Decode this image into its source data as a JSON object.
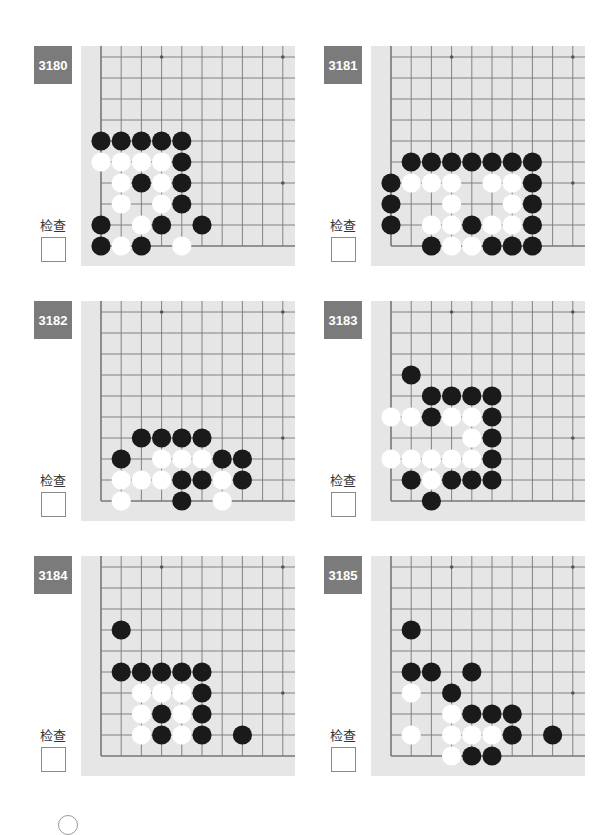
{
  "page": {
    "check_label": "检查",
    "grid": {
      "cols": 10,
      "rows": 10,
      "star_points": [
        [
          3,
          9
        ],
        [
          9,
          9
        ],
        [
          9,
          3
        ]
      ]
    },
    "colors": {
      "badge": "#7b7b7b",
      "board": "#e6e6e6",
      "line": "#777777",
      "black": "#1a1a1a",
      "white": "#ffffff"
    }
  },
  "problems": [
    {
      "number": "3180",
      "black": [
        [
          0,
          5
        ],
        [
          1,
          5
        ],
        [
          2,
          5
        ],
        [
          3,
          5
        ],
        [
          4,
          5
        ],
        [
          4,
          4
        ],
        [
          2,
          3
        ],
        [
          4,
          3
        ],
        [
          4,
          2
        ],
        [
          0,
          1
        ],
        [
          3,
          1
        ],
        [
          5,
          1
        ],
        [
          0,
          0
        ],
        [
          2,
          0
        ]
      ],
      "white": [
        [
          0,
          4
        ],
        [
          1,
          4
        ],
        [
          2,
          4
        ],
        [
          3,
          4
        ],
        [
          1,
          3
        ],
        [
          3,
          3
        ],
        [
          1,
          2
        ],
        [
          3,
          2
        ],
        [
          2,
          1
        ],
        [
          1,
          0
        ],
        [
          4,
          0
        ]
      ]
    },
    {
      "number": "3181",
      "black": [
        [
          1,
          4
        ],
        [
          2,
          4
        ],
        [
          3,
          4
        ],
        [
          4,
          4
        ],
        [
          5,
          4
        ],
        [
          6,
          4
        ],
        [
          7,
          4
        ],
        [
          0,
          3
        ],
        [
          7,
          3
        ],
        [
          0,
          2
        ],
        [
          7,
          2
        ],
        [
          0,
          1
        ],
        [
          4,
          1
        ],
        [
          7,
          1
        ],
        [
          2,
          0
        ],
        [
          5,
          0
        ],
        [
          6,
          0
        ],
        [
          7,
          0
        ]
      ],
      "white": [
        [
          1,
          3
        ],
        [
          2,
          3
        ],
        [
          3,
          3
        ],
        [
          5,
          3
        ],
        [
          6,
          3
        ],
        [
          3,
          2
        ],
        [
          6,
          2
        ],
        [
          2,
          1
        ],
        [
          3,
          1
        ],
        [
          5,
          1
        ],
        [
          6,
          1
        ],
        [
          3,
          0
        ],
        [
          4,
          0
        ]
      ]
    },
    {
      "number": "3182",
      "black": [
        [
          2,
          3
        ],
        [
          3,
          3
        ],
        [
          4,
          3
        ],
        [
          5,
          3
        ],
        [
          1,
          2
        ],
        [
          6,
          2
        ],
        [
          7,
          2
        ],
        [
          4,
          1
        ],
        [
          5,
          1
        ],
        [
          7,
          1
        ],
        [
          4,
          0
        ]
      ],
      "white": [
        [
          3,
          2
        ],
        [
          4,
          2
        ],
        [
          5,
          2
        ],
        [
          1,
          1
        ],
        [
          2,
          1
        ],
        [
          3,
          1
        ],
        [
          6,
          1
        ],
        [
          1,
          0
        ],
        [
          6,
          0
        ]
      ]
    },
    {
      "number": "3183",
      "black": [
        [
          1,
          6
        ],
        [
          2,
          5
        ],
        [
          3,
          5
        ],
        [
          4,
          5
        ],
        [
          5,
          5
        ],
        [
          2,
          4
        ],
        [
          5,
          4
        ],
        [
          5,
          3
        ],
        [
          5,
          2
        ],
        [
          1,
          1
        ],
        [
          3,
          1
        ],
        [
          4,
          1
        ],
        [
          5,
          1
        ],
        [
          2,
          0
        ]
      ],
      "white": [
        [
          0,
          4
        ],
        [
          1,
          4
        ],
        [
          3,
          4
        ],
        [
          4,
          4
        ],
        [
          4,
          3
        ],
        [
          0,
          2
        ],
        [
          1,
          2
        ],
        [
          2,
          2
        ],
        [
          3,
          2
        ],
        [
          4,
          2
        ],
        [
          2,
          1
        ]
      ]
    },
    {
      "number": "3184",
      "black": [
        [
          1,
          6
        ],
        [
          1,
          4
        ],
        [
          2,
          4
        ],
        [
          3,
          4
        ],
        [
          4,
          4
        ],
        [
          5,
          4
        ],
        [
          5,
          3
        ],
        [
          3,
          2
        ],
        [
          5,
          2
        ],
        [
          3,
          1
        ],
        [
          5,
          1
        ],
        [
          7,
          1
        ]
      ],
      "white": [
        [
          2,
          3
        ],
        [
          3,
          3
        ],
        [
          4,
          3
        ],
        [
          2,
          2
        ],
        [
          4,
          2
        ],
        [
          2,
          1
        ],
        [
          4,
          1
        ]
      ]
    },
    {
      "number": "3185",
      "black": [
        [
          1,
          6
        ],
        [
          1,
          4
        ],
        [
          2,
          4
        ],
        [
          4,
          4
        ],
        [
          3,
          3
        ],
        [
          4,
          2
        ],
        [
          5,
          2
        ],
        [
          6,
          2
        ],
        [
          6,
          1
        ],
        [
          8,
          1
        ],
        [
          4,
          0
        ],
        [
          5,
          0
        ]
      ],
      "white": [
        [
          1,
          3
        ],
        [
          3,
          2
        ],
        [
          1,
          1
        ],
        [
          3,
          1
        ],
        [
          4,
          1
        ],
        [
          5,
          1
        ],
        [
          3,
          0
        ]
      ]
    }
  ]
}
